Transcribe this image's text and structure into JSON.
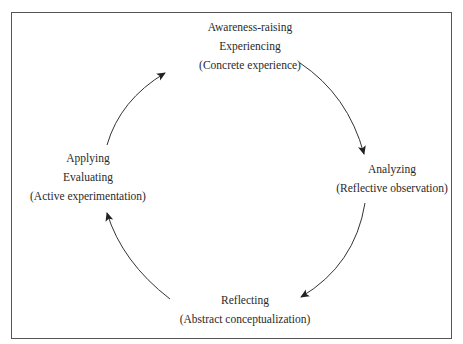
{
  "diagram": {
    "type": "cycle",
    "nodes": [
      {
        "id": "top",
        "lines": [
          "Awareness-raising",
          "Experiencing",
          "(Concrete experience)"
        ]
      },
      {
        "id": "right",
        "lines": [
          "Analyzing",
          "(Reflective observation)"
        ]
      },
      {
        "id": "bottom",
        "lines": [
          "Reflecting",
          "(Abstract conceptualization)"
        ]
      },
      {
        "id": "left",
        "lines": [
          "Applying",
          "Evaluating",
          "(Active experimentation)"
        ]
      }
    ],
    "edges": [
      {
        "from": "top",
        "to": "right"
      },
      {
        "from": "right",
        "to": "bottom"
      },
      {
        "from": "bottom",
        "to": "left"
      },
      {
        "from": "left",
        "to": "top"
      }
    ],
    "colors": {
      "line": "#333333",
      "border": "#555555",
      "text": "#2a2a2a"
    }
  }
}
